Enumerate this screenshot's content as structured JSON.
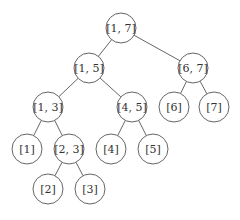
{
  "diagram": {
    "type": "segment-tree",
    "colors": {
      "line": "#555555",
      "text": "#333333",
      "background": "#ffffff"
    },
    "node_radius": 15,
    "nodes": [
      {
        "id": "n17",
        "label": "[1, 7]",
        "x": 121,
        "y": 28
      },
      {
        "id": "n15",
        "label": "[1, 5]",
        "x": 89,
        "y": 68
      },
      {
        "id": "n67",
        "label": "[6, 7]",
        "x": 193,
        "y": 68
      },
      {
        "id": "n13",
        "label": "[1, 3]",
        "x": 48,
        "y": 107
      },
      {
        "id": "n45",
        "label": "[4, 5]",
        "x": 132,
        "y": 107
      },
      {
        "id": "n6",
        "label": "[6]",
        "x": 174,
        "y": 107
      },
      {
        "id": "n7",
        "label": "[7]",
        "x": 214,
        "y": 107
      },
      {
        "id": "n1",
        "label": "[1]",
        "x": 27,
        "y": 149
      },
      {
        "id": "n23",
        "label": "[2, 3]",
        "x": 69,
        "y": 149
      },
      {
        "id": "n4",
        "label": "[4]",
        "x": 111,
        "y": 149
      },
      {
        "id": "n5",
        "label": "[5]",
        "x": 153,
        "y": 149
      },
      {
        "id": "n2",
        "label": "[2]",
        "x": 48,
        "y": 189
      },
      {
        "id": "n3",
        "label": "[3]",
        "x": 90,
        "y": 189
      }
    ],
    "edges": [
      [
        "n17",
        "n15"
      ],
      [
        "n17",
        "n67"
      ],
      [
        "n15",
        "n13"
      ],
      [
        "n15",
        "n45"
      ],
      [
        "n67",
        "n6"
      ],
      [
        "n67",
        "n7"
      ],
      [
        "n13",
        "n1"
      ],
      [
        "n13",
        "n23"
      ],
      [
        "n45",
        "n4"
      ],
      [
        "n45",
        "n5"
      ],
      [
        "n23",
        "n2"
      ],
      [
        "n23",
        "n3"
      ]
    ]
  }
}
